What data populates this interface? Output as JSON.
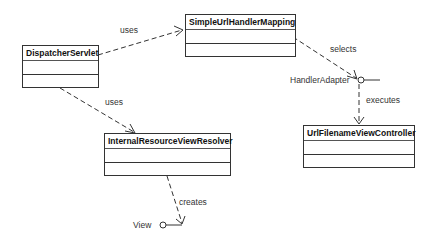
{
  "diagram": {
    "type": "UML class diagram",
    "classes": [
      {
        "id": "dispatcher",
        "name": "DispatcherServlet"
      },
      {
        "id": "mapping",
        "name": "SimpleUrlHandlerMapping"
      },
      {
        "id": "resolver",
        "name": "InternalResourceViewResolver"
      },
      {
        "id": "controller",
        "name": "UrlFilenameViewController"
      }
    ],
    "interfaces": [
      {
        "id": "adapter",
        "name": "HandlerAdapter"
      },
      {
        "id": "view",
        "name": "View"
      }
    ],
    "relations": [
      {
        "from": "dispatcher",
        "to": "mapping",
        "label": "uses",
        "style": "dashed-arrow"
      },
      {
        "from": "dispatcher",
        "to": "resolver",
        "label": "uses",
        "style": "dashed-arrow"
      },
      {
        "from": "mapping",
        "to": "adapter",
        "label": "selects",
        "style": "dashed-arrow"
      },
      {
        "from": "adapter",
        "to": "controller",
        "label": "executes",
        "style": "dashed-arrow"
      },
      {
        "from": "resolver",
        "to": "view",
        "label": "creates",
        "style": "dashed-arrow"
      }
    ]
  },
  "colors": {
    "line": "#333333",
    "background": "#ffffff"
  }
}
